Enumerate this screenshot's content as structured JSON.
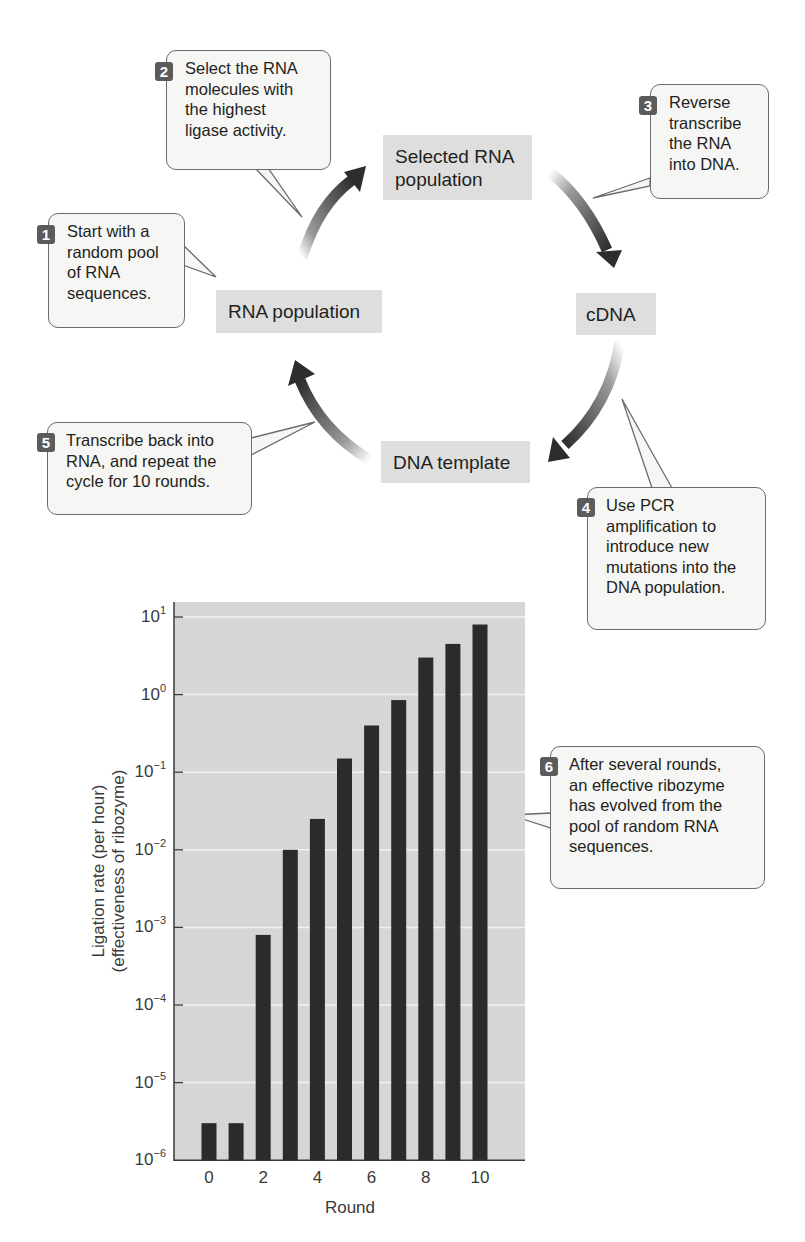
{
  "cycle": {
    "stages": {
      "rna_population": "RNA population",
      "selected_rna_line1": "Selected RNA",
      "selected_rna_line2": "population",
      "cdna": "cDNA",
      "dna_template": "DNA template"
    },
    "steps": [
      {
        "number": "1",
        "lines": [
          "Start with a",
          "random pool",
          "of RNA",
          "sequences."
        ]
      },
      {
        "number": "2",
        "lines": [
          "Select the RNA",
          "molecules with",
          "the highest",
          "ligase activity."
        ]
      },
      {
        "number": "3",
        "lines": [
          "Reverse",
          "transcribe",
          "the RNA",
          "into DNA."
        ]
      },
      {
        "number": "4",
        "lines": [
          "Use PCR",
          "amplification to",
          "introduce new",
          "mutations into the",
          "DNA population."
        ]
      },
      {
        "number": "5",
        "lines": [
          "Transcribe back into",
          "RNA, and repeat the",
          "cycle for 10 rounds."
        ]
      },
      {
        "number": "6",
        "lines": [
          "After several rounds,",
          "an effective ribozyme",
          "has evolved from the",
          "pool of random RNA",
          "sequences."
        ]
      }
    ]
  },
  "chart_data": {
    "type": "bar",
    "title": "",
    "xlabel": "Round",
    "ylabel": "Ligation rate (per hour) (effectiveness of ribozyme)",
    "ylabel_lines": [
      "Ligation rate (per hour)",
      "(effectiveness of ribozyme)"
    ],
    "yscale": "log",
    "ylim": [
      1e-06,
      10
    ],
    "yticks": [
      {
        "base": "10",
        "exp": "1"
      },
      {
        "base": "10",
        "exp": "0"
      },
      {
        "base": "10",
        "exp": "−1"
      },
      {
        "base": "10",
        "exp": "−2"
      },
      {
        "base": "10",
        "exp": "−3"
      },
      {
        "base": "10",
        "exp": "−4"
      },
      {
        "base": "10",
        "exp": "−5"
      },
      {
        "base": "10",
        "exp": "−6"
      }
    ],
    "xtick_labels": [
      "0",
      "2",
      "4",
      "6",
      "8",
      "10"
    ],
    "categories": [
      0,
      1,
      2,
      3,
      4,
      5,
      6,
      7,
      8,
      9,
      10
    ],
    "values": [
      3e-06,
      3e-06,
      0.0008,
      0.01,
      0.025,
      0.15,
      0.4,
      0.85,
      3,
      4.5,
      8
    ],
    "grid": true,
    "legend": null,
    "colors": {
      "bar": "#2b2b2b",
      "plot_bg": "#d6d6d6",
      "gridline": "#f2f2f2"
    }
  }
}
